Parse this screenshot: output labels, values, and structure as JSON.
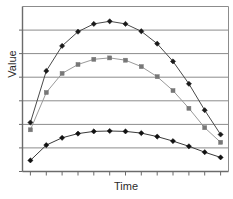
{
  "chart_data": {
    "type": "line",
    "title": "",
    "subtitle": "",
    "xlabel": "Time",
    "ylabel": "Value",
    "x": [
      1,
      2,
      3,
      4,
      5,
      6,
      7,
      8,
      9,
      10,
      11,
      12,
      13
    ],
    "x_tick_labels": [
      "",
      "",
      "",
      "",
      "",
      "",
      "",
      "",
      "",
      "",
      "",
      "",
      ""
    ],
    "y_tick_labels": [
      "",
      "",
      "",
      "",
      "",
      "",
      ""
    ],
    "xlim": [
      0.5,
      13.5
    ],
    "ylim": [
      0,
      7
    ],
    "grid": "horizontal",
    "gridline_values": [
      1,
      2,
      3,
      4,
      5,
      6
    ],
    "legend": "none",
    "legend_position": "none",
    "plot_border": "top-left-right",
    "series": [
      {
        "name": "series-1",
        "marker": "diamond",
        "color": "#4a4a4a",
        "marker_color": "#1a1a1a",
        "values": [
          2.08,
          4.27,
          5.33,
          5.93,
          6.26,
          6.37,
          6.26,
          5.95,
          5.42,
          4.67,
          3.72,
          2.6,
          1.57
        ]
      },
      {
        "name": "series-2",
        "marker": "square",
        "color": "#9a9a9a",
        "marker_color": "#777777",
        "values": [
          1.77,
          3.35,
          4.16,
          4.54,
          4.76,
          4.82,
          4.72,
          4.45,
          4.02,
          3.43,
          2.68,
          1.86,
          1.24
        ]
      },
      {
        "name": "series-3",
        "marker": "diamond",
        "color": "#3a3a3a",
        "marker_color": "#111111",
        "values": [
          0.47,
          1.12,
          1.43,
          1.61,
          1.7,
          1.72,
          1.7,
          1.63,
          1.48,
          1.29,
          1.07,
          0.82,
          0.6
        ]
      }
    ]
  },
  "axis_labels": {
    "y": "Value",
    "x": "Time"
  }
}
